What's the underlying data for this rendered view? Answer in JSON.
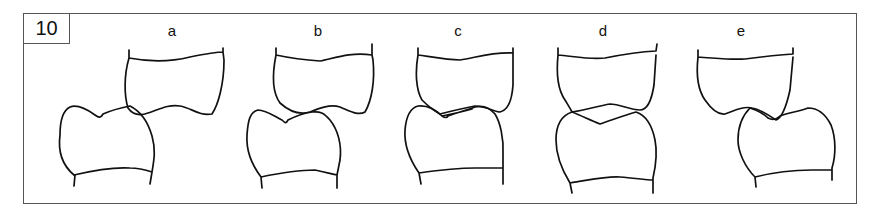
{
  "figure": {
    "number": "10",
    "panels": [
      {
        "label": "a",
        "description": "upper and lower teeth, lower tooth shifted left, cusp contacting only at one point"
      },
      {
        "label": "b",
        "description": "lower tooth shifted slightly left, partial cusp contact"
      },
      {
        "label": "c",
        "description": "teeth aligned, cusps interdigitating with small gap"
      },
      {
        "label": "d",
        "description": "teeth aligned, cusps overlapping (cusp-to-cusp)"
      },
      {
        "label": "e",
        "description": "lower tooth shifted right, partial cusp contact"
      }
    ]
  },
  "colors": {
    "line": "#111111",
    "frame": "#555555",
    "background": "#ffffff"
  }
}
